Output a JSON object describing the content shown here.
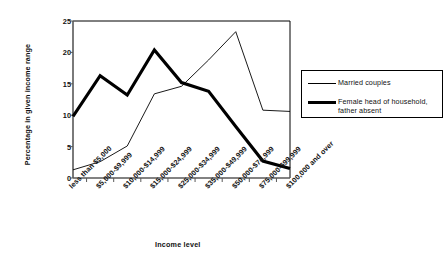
{
  "chart_data": {
    "type": "line",
    "title": "",
    "xlabel": "Income level",
    "ylabel": "Percentage in given income range",
    "ylim": [
      0,
      25
    ],
    "yticks": [
      0,
      5,
      10,
      15,
      20,
      25
    ],
    "grid": false,
    "legend_position": "right",
    "categories": [
      "less than $5,000",
      "$5,000-$9,999",
      "$10,000-$14,999",
      "$15,000-$24,999",
      "$25,000-$34,999",
      "$35,000-$49,999",
      "$50,000-$74,999",
      "$75,000-$99,999",
      "$100,000 and over"
    ],
    "series": [
      {
        "name": "Married couples",
        "style": "thin",
        "color": "#000000",
        "values": [
          1.3,
          2.6,
          5.1,
          13.4,
          14.6,
          18.8,
          23.3,
          10.8,
          10.6
        ]
      },
      {
        "name": "Female head of household, father absent",
        "style": "thick",
        "color": "#000000",
        "values": [
          9.8,
          16.3,
          13.2,
          20.4,
          15.2,
          13.8,
          8.2,
          2.7,
          1.5
        ]
      }
    ]
  },
  "legend": {
    "items": [
      {
        "label": "Married couples"
      },
      {
        "label": "Female head of household,\nfather absent"
      }
    ]
  },
  "colors": {
    "axis": "#595959",
    "line": "#000000",
    "frame": "#000000",
    "text": "#111111",
    "background": "#ffffff"
  }
}
